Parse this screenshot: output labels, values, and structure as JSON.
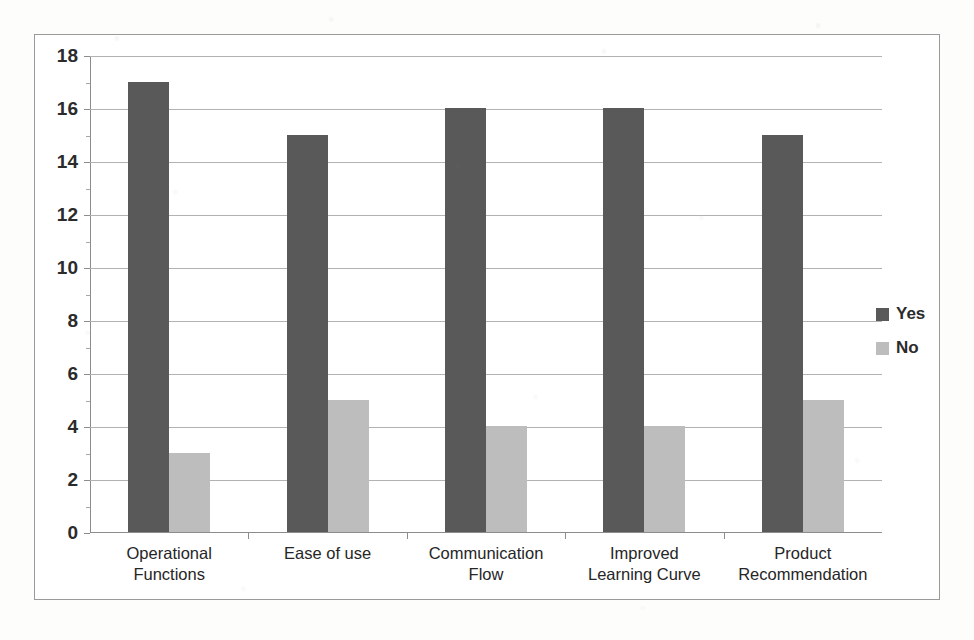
{
  "chart_data": {
    "type": "bar",
    "title": "",
    "subtitle": "",
    "xlabel": "",
    "ylabel": "",
    "categories": [
      "Operational\nFunctions",
      "Ease of use",
      "Communication\nFlow",
      "Improved\nLearning Curve",
      "Product\nRecommendation"
    ],
    "category_lines": [
      [
        "Operational",
        "Functions"
      ],
      [
        "Ease of use"
      ],
      [
        "Communication",
        "Flow"
      ],
      [
        "Improved",
        "Learning Curve"
      ],
      [
        "Product",
        "Recommendation"
      ]
    ],
    "series": [
      {
        "name": "Yes",
        "color": "#595959",
        "values": [
          17,
          15,
          16,
          16,
          15
        ]
      },
      {
        "name": "No",
        "color": "#bdbdbd",
        "values": [
          3,
          5,
          4,
          4,
          5
        ]
      }
    ],
    "ylim": [
      0,
      18
    ],
    "y_ticks": [
      0,
      2,
      4,
      6,
      8,
      10,
      12,
      14,
      16,
      18
    ],
    "y_tick_labels": [
      "0",
      "2",
      "4",
      "6",
      "8",
      "10",
      "12",
      "14",
      "16",
      "18"
    ],
    "grid": true,
    "grid_axis": "y",
    "legend": [
      "Yes",
      "No"
    ],
    "legend_position": "right",
    "bar_group_count": 5,
    "data_labels": false
  },
  "legend": {
    "items": [
      {
        "label": "Yes",
        "color": "#595959"
      },
      {
        "label": "No",
        "color": "#bdbdbd"
      }
    ]
  },
  "colors": {
    "series_yes": "#595959",
    "series_no": "#bdbdbd",
    "gridline": "#b2b2b2",
    "axis": "#8c8c8c",
    "frame_border": "#9a9a9a",
    "plot_background": "#ffffff",
    "page_background": "#fdfdfc",
    "text": "#2b2b2b"
  }
}
